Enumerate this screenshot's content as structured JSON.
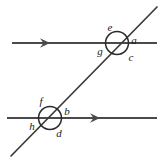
{
  "figure": {
    "colors": {
      "background": "#ffffff",
      "line": "#4a4a4a",
      "transversal": "#3a3a3a",
      "circle": "#2b2b2b",
      "label": "#1a1a1a"
    },
    "lines": [
      {
        "name": "top-parallel-line",
        "kind": "horizontal-ray",
        "x1": 12,
        "y1": 43,
        "x2": 157,
        "y2": 43,
        "arrow_at": {
          "x": 48,
          "y": 43,
          "direction": "right"
        }
      },
      {
        "name": "bottom-parallel-line",
        "kind": "horizontal-ray",
        "x1": 7,
        "y1": 118,
        "x2": 157,
        "y2": 118,
        "arrow_at": {
          "x": 98,
          "y": 118,
          "direction": "right"
        }
      },
      {
        "name": "transversal-line",
        "kind": "diagonal",
        "x1": 11,
        "y1": 156,
        "x2": 157,
        "y2": 7,
        "arrow_at": null
      }
    ],
    "intersections": [
      {
        "name": "upper-intersection",
        "cx": 117,
        "cy": 43,
        "r": 11.5
      },
      {
        "name": "lower-intersection",
        "cx": 50,
        "cy": 118,
        "r": 11.5
      }
    ],
    "labels": [
      {
        "id": "e",
        "text": "e",
        "x": 110,
        "y": 27
      },
      {
        "id": "a",
        "text": "a",
        "x": 134,
        "y": 40
      },
      {
        "id": "g",
        "text": "g",
        "x": 100,
        "y": 51
      },
      {
        "id": "c",
        "text": "c",
        "x": 131,
        "y": 57
      },
      {
        "id": "f",
        "text": "f",
        "x": 41,
        "y": 101
      },
      {
        "id": "b",
        "text": "b",
        "x": 67,
        "y": 111
      },
      {
        "id": "h",
        "text": "h",
        "x": 32,
        "y": 126
      },
      {
        "id": "d",
        "text": "d",
        "x": 59,
        "y": 133
      }
    ]
  }
}
